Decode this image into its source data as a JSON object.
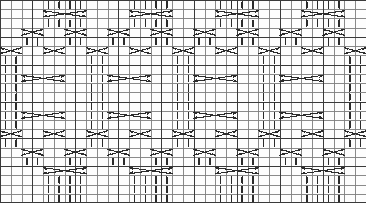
{
  "document": {
    "title": "Knitting Cable Stitch Chart",
    "watermark": ""
  },
  "chart_data": {
    "type": "heatmap",
    "xlabel": "",
    "ylabel": "",
    "grid": true,
    "legend_position": "none",
    "columns": 34,
    "rows": 22,
    "cell_width": 10.76,
    "cell_height": 9.0,
    "colors": {
      "background": "#fdfdfd",
      "grid_minor": "#7d7d7d",
      "grid_major": "#3a3a3a",
      "symbol": "#2b2b2b"
    },
    "symbol_legend": [
      {
        "name": "knit-stitch",
        "glyph": "|",
        "meaning": "knit on right side, purl on wrong side"
      },
      {
        "name": "purl-stitch",
        "glyph": "blank",
        "meaning": "purl on right side, knit on wrong side"
      },
      {
        "name": "cable-4-front",
        "glyph": "cross-4",
        "meaning": "4 stitch cable cross, spans 4 columns"
      },
      {
        "name": "cable-2-cross",
        "glyph": "cross-2",
        "meaning": "2 stitch cable cross, spans 2 columns"
      }
    ],
    "categories": [
      "1",
      "2",
      "3",
      "4",
      "5",
      "6",
      "7",
      "8",
      "9",
      "10",
      "11",
      "12",
      "13",
      "14",
      "15",
      "16",
      "17",
      "18",
      "19",
      "20",
      "21",
      "22",
      "23",
      "24",
      "25",
      "26",
      "27",
      "28",
      "29",
      "30",
      "31",
      "32",
      "33",
      "34"
    ],
    "row_labels": [
      "1",
      "2",
      "3",
      "4",
      "5",
      "6",
      "7",
      "8",
      "9",
      "10",
      "11",
      "12",
      "13",
      "14",
      "15",
      "16",
      "17",
      "18",
      "19",
      "20",
      "21",
      "22"
    ],
    "major_column_lines": [
      0,
      3,
      7,
      11,
      15,
      18,
      22,
      26,
      30,
      34
    ],
    "major_row_lines": [
      0,
      4,
      7,
      11,
      15,
      18,
      22
    ],
    "knit_cells": [
      {
        "row": 0,
        "cols": [
          4,
          5,
          6,
          7,
          12,
          13,
          14,
          15,
          20,
          21,
          22,
          23,
          28,
          29,
          30,
          31
        ]
      },
      {
        "row": 2,
        "cols": [
          4,
          5,
          6,
          7,
          12,
          13,
          14,
          15,
          20,
          21,
          22,
          23,
          28,
          29,
          30,
          31
        ]
      },
      {
        "row": 4,
        "cols": [
          2,
          3,
          6,
          7,
          10,
          11,
          14,
          15,
          18,
          19,
          22,
          23,
          26,
          27,
          30,
          31
        ]
      },
      {
        "row": 6,
        "cols": [
          0,
          1,
          8,
          9,
          16,
          17,
          24,
          25,
          32,
          33
        ]
      },
      {
        "row": 7,
        "cols": [
          0,
          1,
          8,
          9,
          16,
          17,
          24,
          25,
          32,
          33
        ]
      },
      {
        "row": 8,
        "cols": [
          0,
          1,
          8,
          9,
          16,
          17,
          24,
          25,
          32,
          33
        ]
      },
      {
        "row": 9,
        "cols": [
          0,
          1,
          8,
          9,
          16,
          17,
          24,
          25,
          32,
          33
        ]
      },
      {
        "row": 10,
        "cols": [
          0,
          1,
          8,
          9,
          16,
          17,
          24,
          25,
          32,
          33
        ]
      },
      {
        "row": 11,
        "cols": [
          0,
          1,
          8,
          9,
          16,
          17,
          24,
          25,
          32,
          33
        ]
      },
      {
        "row": 12,
        "cols": [
          0,
          1,
          8,
          9,
          16,
          17,
          24,
          25,
          32,
          33
        ]
      },
      {
        "row": 13,
        "cols": [
          0,
          1,
          8,
          9,
          16,
          17,
          24,
          25,
          32,
          33
        ]
      },
      {
        "row": 15,
        "cols": [
          0,
          1,
          8,
          9,
          16,
          17,
          24,
          25,
          32,
          33
        ]
      },
      {
        "row": 17,
        "cols": [
          2,
          3,
          6,
          7,
          10,
          11,
          14,
          15,
          18,
          19,
          22,
          23,
          26,
          27,
          30,
          31
        ]
      },
      {
        "row": 19,
        "cols": [
          4,
          5,
          6,
          7,
          12,
          13,
          14,
          15,
          20,
          21,
          22,
          23,
          28,
          29,
          30,
          31
        ]
      },
      {
        "row": 20,
        "cols": [
          4,
          5,
          6,
          7,
          12,
          13,
          14,
          15,
          20,
          21,
          22,
          23,
          28,
          29,
          30,
          31
        ]
      },
      {
        "row": 21,
        "cols": [
          4,
          5,
          6,
          7,
          12,
          13,
          14,
          15,
          20,
          21,
          22,
          23,
          28,
          29,
          30,
          31
        ]
      }
    ],
    "cable_cells": [
      {
        "row": 1,
        "col": 4,
        "span": 4,
        "name": "cable-4-front"
      },
      {
        "row": 1,
        "col": 12,
        "span": 4,
        "name": "cable-4-front"
      },
      {
        "row": 1,
        "col": 20,
        "span": 4,
        "name": "cable-4-front"
      },
      {
        "row": 1,
        "col": 28,
        "span": 4,
        "name": "cable-4-front"
      },
      {
        "row": 3,
        "col": 2,
        "span": 2,
        "name": "cable-2-cross"
      },
      {
        "row": 3,
        "col": 6,
        "span": 2,
        "name": "cable-2-cross"
      },
      {
        "row": 3,
        "col": 10,
        "span": 2,
        "name": "cable-2-cross"
      },
      {
        "row": 3,
        "col": 14,
        "span": 2,
        "name": "cable-2-cross"
      },
      {
        "row": 3,
        "col": 18,
        "span": 2,
        "name": "cable-2-cross"
      },
      {
        "row": 3,
        "col": 22,
        "span": 2,
        "name": "cable-2-cross"
      },
      {
        "row": 3,
        "col": 26,
        "span": 2,
        "name": "cable-2-cross"
      },
      {
        "row": 3,
        "col": 30,
        "span": 2,
        "name": "cable-2-cross"
      },
      {
        "row": 5,
        "col": 0,
        "span": 2,
        "name": "cable-2-cross"
      },
      {
        "row": 5,
        "col": 4,
        "span": 2,
        "name": "cable-2-cross"
      },
      {
        "row": 5,
        "col": 8,
        "span": 2,
        "name": "cable-2-cross"
      },
      {
        "row": 5,
        "col": 12,
        "span": 2,
        "name": "cable-2-cross"
      },
      {
        "row": 5,
        "col": 16,
        "span": 2,
        "name": "cable-2-cross"
      },
      {
        "row": 5,
        "col": 20,
        "span": 2,
        "name": "cable-2-cross"
      },
      {
        "row": 5,
        "col": 24,
        "span": 2,
        "name": "cable-2-cross"
      },
      {
        "row": 5,
        "col": 28,
        "span": 2,
        "name": "cable-2-cross"
      },
      {
        "row": 5,
        "col": 32,
        "span": 2,
        "name": "cable-2-cross"
      },
      {
        "row": 8,
        "col": 2,
        "span": 4,
        "name": "cable-4-front"
      },
      {
        "row": 8,
        "col": 10,
        "span": 4,
        "name": "cable-4-front"
      },
      {
        "row": 8,
        "col": 18,
        "span": 4,
        "name": "cable-4-front"
      },
      {
        "row": 8,
        "col": 26,
        "span": 4,
        "name": "cable-4-front"
      },
      {
        "row": 12,
        "col": 2,
        "span": 4,
        "name": "cable-4-front"
      },
      {
        "row": 12,
        "col": 10,
        "span": 4,
        "name": "cable-4-front"
      },
      {
        "row": 12,
        "col": 18,
        "span": 4,
        "name": "cable-4-front"
      },
      {
        "row": 12,
        "col": 26,
        "span": 4,
        "name": "cable-4-front"
      },
      {
        "row": 14,
        "col": 0,
        "span": 2,
        "name": "cable-2-cross"
      },
      {
        "row": 14,
        "col": 4,
        "span": 2,
        "name": "cable-2-cross"
      },
      {
        "row": 14,
        "col": 8,
        "span": 2,
        "name": "cable-2-cross"
      },
      {
        "row": 14,
        "col": 12,
        "span": 2,
        "name": "cable-2-cross"
      },
      {
        "row": 14,
        "col": 16,
        "span": 2,
        "name": "cable-2-cross"
      },
      {
        "row": 14,
        "col": 20,
        "span": 2,
        "name": "cable-2-cross"
      },
      {
        "row": 14,
        "col": 24,
        "span": 2,
        "name": "cable-2-cross"
      },
      {
        "row": 14,
        "col": 28,
        "span": 2,
        "name": "cable-2-cross"
      },
      {
        "row": 14,
        "col": 32,
        "span": 2,
        "name": "cable-2-cross"
      },
      {
        "row": 16,
        "col": 2,
        "span": 2,
        "name": "cable-2-cross"
      },
      {
        "row": 16,
        "col": 6,
        "span": 2,
        "name": "cable-2-cross"
      },
      {
        "row": 16,
        "col": 10,
        "span": 2,
        "name": "cable-2-cross"
      },
      {
        "row": 16,
        "col": 14,
        "span": 2,
        "name": "cable-2-cross"
      },
      {
        "row": 16,
        "col": 18,
        "span": 2,
        "name": "cable-2-cross"
      },
      {
        "row": 16,
        "col": 22,
        "span": 2,
        "name": "cable-2-cross"
      },
      {
        "row": 16,
        "col": 26,
        "span": 2,
        "name": "cable-2-cross"
      },
      {
        "row": 16,
        "col": 30,
        "span": 2,
        "name": "cable-2-cross"
      },
      {
        "row": 18,
        "col": 4,
        "span": 4,
        "name": "cable-4-front"
      },
      {
        "row": 18,
        "col": 12,
        "span": 4,
        "name": "cable-4-front"
      },
      {
        "row": 18,
        "col": 20,
        "span": 4,
        "name": "cable-4-front"
      },
      {
        "row": 18,
        "col": 28,
        "span": 4,
        "name": "cable-4-front"
      }
    ]
  }
}
